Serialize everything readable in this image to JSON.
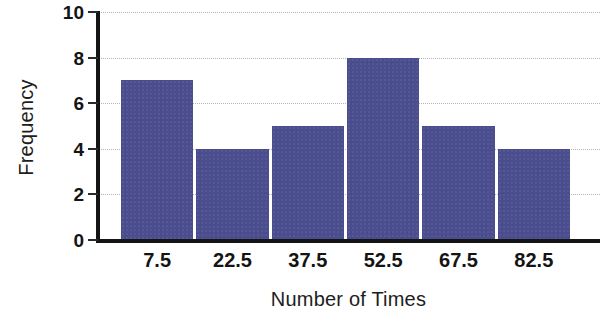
{
  "chart_data": {
    "type": "bar",
    "title": "",
    "subtitle": "",
    "xlabel": "Number of Times",
    "ylabel": "Frequency",
    "categories": [
      "7.5",
      "22.5",
      "37.5",
      "52.5",
      "67.5",
      "82.5"
    ],
    "values": [
      7,
      4,
      5,
      8,
      5,
      4
    ],
    "xlim": [
      0,
      90
    ],
    "ylim": [
      0,
      10
    ],
    "y_ticks": [
      "0",
      "2",
      "4",
      "6",
      "8",
      "10"
    ],
    "y_tick_values": [
      0,
      2,
      4,
      6,
      8,
      10
    ],
    "x_ticks": [
      "7.5",
      "22.5",
      "37.5",
      "52.5",
      "67.5",
      "82.5"
    ],
    "bin_width": 15,
    "grid": "horizontal-dotted",
    "legend": "none",
    "bar_color": "#4b4e8e",
    "axis_color": "#141414",
    "gridline_color": "#b4b4b4",
    "background_color": "#ffffff"
  }
}
